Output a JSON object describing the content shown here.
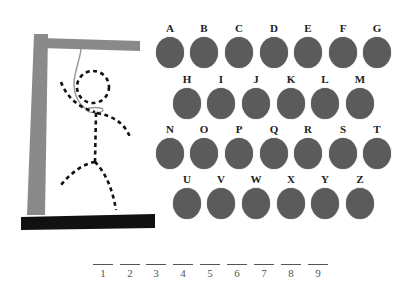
{
  "game": "Hangman",
  "colors": {
    "gallows": "#8a8a8a",
    "base": "#111111",
    "rope": "#9a9a9a",
    "figure": "#111111",
    "letter_disc": "#5b5b5b",
    "letter_label": "#222222",
    "slot": "#555555"
  },
  "keyboard": {
    "rows": [
      {
        "y": 22,
        "letters": [
          {
            "label": "A",
            "x": 155
          },
          {
            "label": "B",
            "x": 189
          },
          {
            "label": "C",
            "x": 224
          },
          {
            "label": "D",
            "x": 259
          },
          {
            "label": "E",
            "x": 293
          },
          {
            "label": "F",
            "x": 328
          },
          {
            "label": "G",
            "x": 362
          }
        ]
      },
      {
        "y": 73,
        "letters": [
          {
            "label": "H",
            "x": 172
          },
          {
            "label": "I",
            "x": 206
          },
          {
            "label": "J",
            "x": 241
          },
          {
            "label": "K",
            "x": 276
          },
          {
            "label": "L",
            "x": 310
          },
          {
            "label": "M",
            "x": 345
          }
        ]
      },
      {
        "y": 123,
        "letters": [
          {
            "label": "N",
            "x": 155
          },
          {
            "label": "O",
            "x": 189
          },
          {
            "label": "P",
            "x": 224
          },
          {
            "label": "Q",
            "x": 259
          },
          {
            "label": "R",
            "x": 293
          },
          {
            "label": "S",
            "x": 328
          },
          {
            "label": "T",
            "x": 362
          }
        ]
      },
      {
        "y": 173,
        "letters": [
          {
            "label": "U",
            "x": 172
          },
          {
            "label": "V",
            "x": 206
          },
          {
            "label": "W",
            "x": 241
          },
          {
            "label": "X",
            "x": 276
          },
          {
            "label": "Y",
            "x": 310
          },
          {
            "label": "Z",
            "x": 345
          }
        ]
      }
    ]
  },
  "word_slots": [
    {
      "num": "1",
      "x": 93
    },
    {
      "num": "2",
      "x": 120
    },
    {
      "num": "3",
      "x": 146
    },
    {
      "num": "4",
      "x": 173
    },
    {
      "num": "5",
      "x": 200
    },
    {
      "num": "6",
      "x": 227
    },
    {
      "num": "7",
      "x": 254
    },
    {
      "num": "8",
      "x": 281
    },
    {
      "num": "9",
      "x": 308
    }
  ]
}
